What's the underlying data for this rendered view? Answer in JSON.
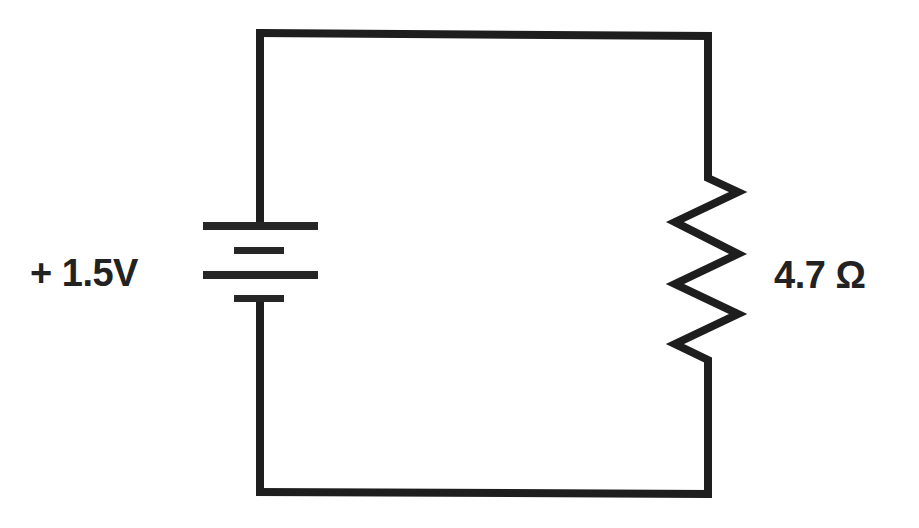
{
  "diagram": {
    "type": "circuit-schematic",
    "colors": {
      "background": "#ffffff",
      "line": "#1e1e1e",
      "text": "#222222"
    },
    "components": {
      "battery": {
        "symbol": "battery-icon",
        "polarity": "+",
        "value": "1.5V",
        "label": "+ 1.5V"
      },
      "resistor": {
        "symbol": "resistor-icon",
        "value": "4.7",
        "unit": "Ω",
        "label": "4.7 Ω"
      }
    },
    "wires": [
      "top wire: battery top to resistor top",
      "right wire: down to resistor",
      "bottom wire: resistor bottom to battery bottom",
      "left wire: up to battery"
    ]
  }
}
